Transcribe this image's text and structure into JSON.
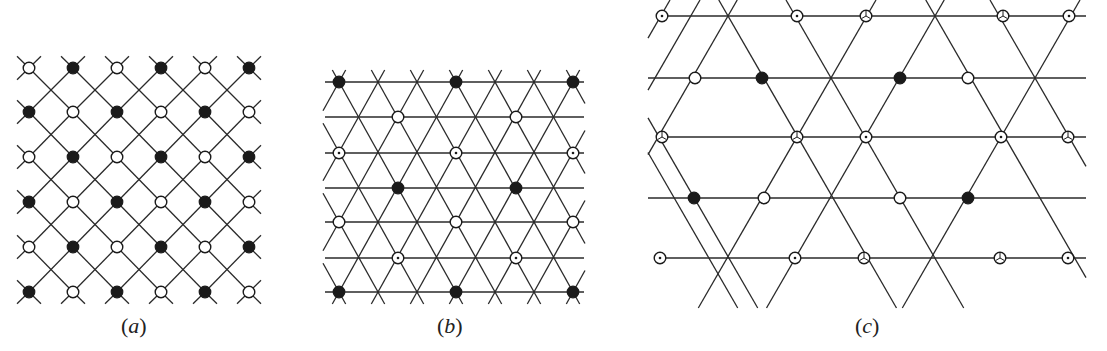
{
  "figure": {
    "panels": [
      {
        "id": "a",
        "caption": "(a)",
        "caption_letter": "a",
        "lattice": "square (rotated 45°)",
        "node_grid": {
          "x": [
            29,
            73,
            117,
            161,
            205,
            249
          ],
          "y": [
            68,
            112,
            157,
            202,
            247,
            292
          ]
        },
        "node_pattern": [
          [
            "open",
            "filled",
            "open",
            "filled",
            "open",
            "filled"
          ],
          [
            "filled",
            "open",
            "filled",
            "open",
            "filled",
            "open"
          ],
          [
            "open",
            "filled",
            "open",
            "filled",
            "open",
            "filled"
          ],
          [
            "filled",
            "open",
            "filled",
            "open",
            "filled",
            "open"
          ],
          [
            "open",
            "filled",
            "open",
            "filled",
            "open",
            "filled"
          ],
          [
            "filled",
            "open",
            "filled",
            "open",
            "filled",
            "open"
          ]
        ]
      },
      {
        "id": "b",
        "caption": "(b)",
        "caption_letter": "b",
        "lattice": "triangular",
        "rows_y": [
          82,
          117,
          153,
          188,
          222,
          258,
          292
        ],
        "x_range": [
          325,
          583
        ],
        "column_step": 39,
        "nodes": [
          {
            "x": 339,
            "y": 82,
            "type": "filled"
          },
          {
            "x": 456,
            "y": 82,
            "type": "filled"
          },
          {
            "x": 573,
            "y": 82,
            "type": "filled"
          },
          {
            "x": 398,
            "y": 117,
            "type": "open"
          },
          {
            "x": 516,
            "y": 117,
            "type": "open"
          },
          {
            "x": 339,
            "y": 153,
            "type": "dotted"
          },
          {
            "x": 456,
            "y": 153,
            "type": "dotted"
          },
          {
            "x": 573,
            "y": 153,
            "type": "dotted"
          },
          {
            "x": 398,
            "y": 188,
            "type": "filled"
          },
          {
            "x": 516,
            "y": 188,
            "type": "filled"
          },
          {
            "x": 339,
            "y": 222,
            "type": "open"
          },
          {
            "x": 456,
            "y": 222,
            "type": "open"
          },
          {
            "x": 573,
            "y": 222,
            "type": "open"
          },
          {
            "x": 398,
            "y": 258,
            "type": "dotted"
          },
          {
            "x": 516,
            "y": 258,
            "type": "dotted"
          },
          {
            "x": 339,
            "y": 292,
            "type": "filled"
          },
          {
            "x": 456,
            "y": 292,
            "type": "filled"
          },
          {
            "x": 573,
            "y": 292,
            "type": "filled"
          }
        ]
      },
      {
        "id": "c",
        "caption": "(c)",
        "caption_letter": "c",
        "lattice": "kagome-like (hexagonal star)",
        "rows_y": [
          16,
          78,
          137,
          198,
          258
        ],
        "crossings": [
          {
            "x": 728,
            "y": 16
          },
          {
            "x": 935,
            "y": 16
          },
          {
            "x": 831,
            "y": 78
          },
          {
            "x": 1035,
            "y": 78
          },
          {
            "x": 728,
            "y": 137
          },
          {
            "x": 934,
            "y": 137
          },
          {
            "x": 830,
            "y": 198
          },
          {
            "x": 1035,
            "y": 198
          },
          {
            "x": 728,
            "y": 258
          },
          {
            "x": 932,
            "y": 258
          }
        ],
        "nodes": [
          {
            "x": 662,
            "y": 16,
            "type": "dotted"
          },
          {
            "x": 797,
            "y": 16,
            "type": "dotted"
          },
          {
            "x": 866,
            "y": 16,
            "type": "y-glyph"
          },
          {
            "x": 1003,
            "y": 16,
            "type": "y-glyph"
          },
          {
            "x": 1069,
            "y": 16,
            "type": "dotted"
          },
          {
            "x": 695,
            "y": 78,
            "type": "open"
          },
          {
            "x": 762,
            "y": 78,
            "type": "filled"
          },
          {
            "x": 900,
            "y": 78,
            "type": "filled"
          },
          {
            "x": 968,
            "y": 78,
            "type": "open"
          },
          {
            "x": 662,
            "y": 137,
            "type": "y-glyph"
          },
          {
            "x": 797,
            "y": 137,
            "type": "y-glyph"
          },
          {
            "x": 866,
            "y": 137,
            "type": "dotted"
          },
          {
            "x": 1001,
            "y": 137,
            "type": "dotted"
          },
          {
            "x": 1068,
            "y": 137,
            "type": "y-glyph"
          },
          {
            "x": 694,
            "y": 198,
            "type": "filled"
          },
          {
            "x": 764,
            "y": 198,
            "type": "open"
          },
          {
            "x": 900,
            "y": 198,
            "type": "open"
          },
          {
            "x": 968,
            "y": 198,
            "type": "filled"
          },
          {
            "x": 660,
            "y": 258,
            "type": "dotted"
          },
          {
            "x": 795,
            "y": 258,
            "type": "dotted"
          },
          {
            "x": 864,
            "y": 258,
            "type": "y-glyph"
          },
          {
            "x": 1000,
            "y": 258,
            "type": "y-glyph"
          },
          {
            "x": 1068,
            "y": 258,
            "type": "dotted"
          }
        ]
      }
    ],
    "legend_symbols": {
      "open": "open-circle",
      "filled": "filled-circle",
      "dotted": "circle-with-center-dot",
      "y-glyph": "circle-with-Y-mark"
    },
    "colors": {
      "ink": "#1a1a1a",
      "background": "#ffffff"
    }
  }
}
